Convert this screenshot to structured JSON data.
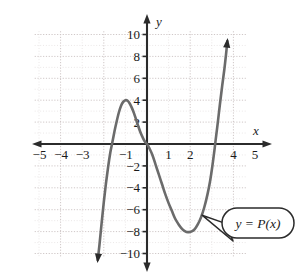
{
  "chart_data": {
    "type": "line",
    "title": "",
    "xlabel": "x",
    "ylabel": "y",
    "xlim": [
      -5.6,
      5.6
    ],
    "ylim": [
      -11.5,
      11.0
    ],
    "grid": true,
    "grid_spacing": 1,
    "grid_major_spacing": 2,
    "grid_extent": {
      "xmin": -5.2,
      "xmax": 4.6,
      "ymin": -10.3,
      "ymax": 10.3
    },
    "legend": "none",
    "xticks": [
      -5,
      -4,
      -3,
      -2,
      -1,
      1,
      2,
      3,
      4,
      5
    ],
    "xtick_labels_visible": [
      "-5",
      "-4",
      "-3",
      "-1",
      "1",
      "2",
      "4",
      "5"
    ],
    "yticks": [
      -10,
      -8,
      -6,
      -4,
      -2,
      2,
      4,
      6,
      8,
      10
    ],
    "ytick_labels_visible": [
      "10",
      "8",
      "6",
      "4",
      "-2",
      "-4",
      "-6",
      "-8",
      "-10"
    ],
    "series": [
      {
        "name": "y = P(x)",
        "color": "#6b6b6b",
        "arrow_start": true,
        "arrow_end": true,
        "points": [
          {
            "x": -2.28,
            "y": -10.6
          },
          {
            "x": -2.2,
            "y": -9.2
          },
          {
            "x": -2.1,
            "y": -7.2
          },
          {
            "x": -2.0,
            "y": -5.3
          },
          {
            "x": -1.9,
            "y": -3.6
          },
          {
            "x": -1.8,
            "y": -2.1
          },
          {
            "x": -1.7,
            "y": -0.8
          },
          {
            "x": -1.62,
            "y": 0.0
          },
          {
            "x": -1.5,
            "y": 1.2
          },
          {
            "x": -1.4,
            "y": 2.1
          },
          {
            "x": -1.3,
            "y": 2.9
          },
          {
            "x": -1.2,
            "y": 3.5
          },
          {
            "x": -1.1,
            "y": 3.85
          },
          {
            "x": -1.0,
            "y": 4.0
          },
          {
            "x": -0.9,
            "y": 3.95
          },
          {
            "x": -0.8,
            "y": 3.7
          },
          {
            "x": -0.7,
            "y": 3.3
          },
          {
            "x": -0.6,
            "y": 2.8
          },
          {
            "x": -0.5,
            "y": 2.2
          },
          {
            "x": -0.4,
            "y": 1.6
          },
          {
            "x": -0.3,
            "y": 1.05
          },
          {
            "x": -0.2,
            "y": 0.6
          },
          {
            "x": -0.1,
            "y": 0.22
          },
          {
            "x": 0.0,
            "y": 0.0
          },
          {
            "x": 0.1,
            "y": -0.35
          },
          {
            "x": 0.25,
            "y": -1.0
          },
          {
            "x": 0.4,
            "y": -1.9
          },
          {
            "x": 0.55,
            "y": -2.8
          },
          {
            "x": 0.7,
            "y": -3.7
          },
          {
            "x": 0.85,
            "y": -4.6
          },
          {
            "x": 1.0,
            "y": -5.4
          },
          {
            "x": 1.15,
            "y": -6.1
          },
          {
            "x": 1.3,
            "y": -6.8
          },
          {
            "x": 1.45,
            "y": -7.3
          },
          {
            "x": 1.6,
            "y": -7.7
          },
          {
            "x": 1.75,
            "y": -7.95
          },
          {
            "x": 1.9,
            "y": -8.05
          },
          {
            "x": 2.05,
            "y": -8.0
          },
          {
            "x": 2.2,
            "y": -7.8
          },
          {
            "x": 2.35,
            "y": -7.35
          },
          {
            "x": 2.5,
            "y": -6.7
          },
          {
            "x": 2.65,
            "y": -5.8
          },
          {
            "x": 2.8,
            "y": -4.6
          },
          {
            "x": 2.92,
            "y": -3.4
          },
          {
            "x": 3.02,
            "y": -2.1
          },
          {
            "x": 3.12,
            "y": -0.6
          },
          {
            "x": 3.18,
            "y": 0.4
          },
          {
            "x": 3.28,
            "y": 2.0
          },
          {
            "x": 3.38,
            "y": 3.7
          },
          {
            "x": 3.48,
            "y": 5.3
          },
          {
            "x": 3.58,
            "y": 6.8
          },
          {
            "x": 3.66,
            "y": 8.2
          },
          {
            "x": 3.72,
            "y": 9.4
          }
        ],
        "local_max": {
          "x": -1.0,
          "y": 4
        },
        "local_min": {
          "x": 1.9,
          "y": -8
        },
        "x_intercepts": [
          -1.62,
          0.0,
          3.15
        ],
        "y_intercept": 0
      }
    ],
    "annotations": [
      {
        "name": "curve-callout",
        "text": "y = P(x)",
        "shape": "rounded-balloon",
        "anchor_point": {
          "x": 2.55,
          "y": -6.5
        }
      }
    ]
  },
  "axes": {
    "x_axis_label": "x",
    "y_axis_label": "y"
  },
  "colors": {
    "curve": "#6b6b6b",
    "axis": "#2b2b2b",
    "grid_minor": "#e3dede",
    "grid_major": "#cfc7c7",
    "text": "#1a1a1a",
    "background": "#ffffff"
  }
}
